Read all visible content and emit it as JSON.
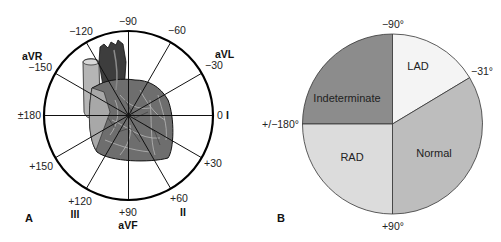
{
  "panel_a": {
    "label": "A",
    "angle_labels": {
      "m90": "−90",
      "m120": "−120",
      "m60": "−60",
      "m150": "−150",
      "m30": "−30",
      "pm180": "±180",
      "zero": "0",
      "p150": "+150",
      "p30": "+30",
      "p120": "+120",
      "p60": "+60",
      "p90": "+90"
    },
    "lead_labels": {
      "aVR": "aVR",
      "aVL": "aVL",
      "I": "I",
      "III": "III",
      "II": "II",
      "aVF": "aVF"
    },
    "center_image": "heart-illustration"
  },
  "panel_b": {
    "label": "B",
    "boundary_labels": {
      "top": "−90°",
      "right": "−31°",
      "left": "+/−180°",
      "bottom": "+90°"
    },
    "segments": [
      {
        "name": "Indeterminate",
        "from_deg": -180,
        "to_deg": -90,
        "color": "#8c8c8c"
      },
      {
        "name": "LAD",
        "from_deg": -90,
        "to_deg": -31,
        "color": "#f4f4f4"
      },
      {
        "name": "Normal",
        "from_deg": -31,
        "to_deg": 90,
        "color": "#bdbdbd"
      },
      {
        "name": "RAD",
        "from_deg": 90,
        "to_deg": 180,
        "color": "#dcdcdc"
      }
    ]
  }
}
